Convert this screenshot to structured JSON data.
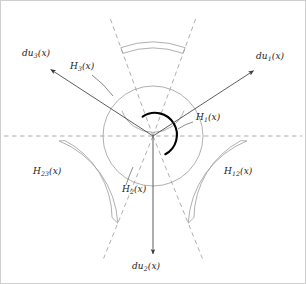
{
  "figure": {
    "name": "conormal-directions-diagram",
    "background_color": "#ffffff",
    "center": {
      "x": 153,
      "y": 136
    },
    "colors": {
      "solid_line": "#5a5a5a",
      "dashed_line": "#9a9a9a",
      "arc_light": "#8d8d8d",
      "arc_bold": "#000000",
      "label_text": "#1a1a1a",
      "border": "#cccccc"
    }
  },
  "labels": {
    "du1": {
      "text": "du",
      "sub": "1",
      "arg": "(x)",
      "x": 256,
      "y": 57
    },
    "du2": {
      "text": "du",
      "sub": "2",
      "arg": "(x)",
      "x": 132,
      "y": 266
    },
    "du3": {
      "text": "du",
      "sub": "3",
      "arg": "(x)",
      "x": 22,
      "y": 54
    },
    "H1": {
      "text": "H",
      "sub": "1",
      "arg": "(x)",
      "x": 196,
      "y": 118
    },
    "H2": {
      "text": "H",
      "sub": "2",
      "arg": "(x)",
      "x": 122,
      "y": 190
    },
    "H3": {
      "text": "H",
      "sub": "3",
      "arg": "(x)",
      "x": 70,
      "y": 67
    },
    "H12": {
      "text": "H",
      "sub": "12",
      "arg": "(x)",
      "x": 224,
      "y": 172
    },
    "H23": {
      "text": "H",
      "sub": "23",
      "arg": "(x)",
      "x": 33,
      "y": 172
    }
  },
  "geometry": {
    "arrows": [
      {
        "name": "du1-arrow",
        "angle_deg": 33,
        "length": 120
      },
      {
        "name": "du2-arrow",
        "angle_deg": -90,
        "length": 118
      },
      {
        "name": "du3-arrow",
        "angle_deg": 147,
        "length": 122
      }
    ],
    "dashed_rays": [
      {
        "name": "ray-upper-right",
        "angle_deg": 70,
        "length": 128
      },
      {
        "name": "ray-upper-left",
        "angle_deg": 110,
        "length": 128
      },
      {
        "name": "ray-lower-left",
        "angle_deg": 248,
        "length": 132
      },
      {
        "name": "ray-lower-right",
        "angle_deg": 292,
        "length": 132
      }
    ],
    "dashed_axis": {
      "name": "horizontal-axis",
      "y": 136,
      "x1": 4,
      "x2": 302
    },
    "bold_arc": {
      "name": "H1-bold-arc",
      "radius": 22,
      "start_deg": 118,
      "end_deg": -56
    },
    "light_circle": {
      "name": "outer-light-circle",
      "radius": 50
    },
    "inner_arc": {
      "name": "inner-light-arc",
      "radius": 33,
      "start_deg": 200,
      "end_deg": 340
    },
    "sector_arc_pairs": [
      {
        "name": "top-sector-arcs",
        "radius_outer": 94,
        "radius_inner": 88,
        "start_deg": 70,
        "end_deg": 110
      },
      {
        "name": "lower-right-sector-arcs",
        "radius_outer": 94,
        "radius_inner": 88,
        "start_deg": -68,
        "end_deg": -3
      },
      {
        "name": "lower-left-sector-arcs",
        "radius_outer": 94,
        "radius_inner": 88,
        "start_deg": 183,
        "end_deg": 248
      }
    ],
    "leaders": [
      {
        "name": "H1-leader",
        "x1": 193,
        "y1": 122,
        "x2": 178,
        "y2": 129
      },
      {
        "name": "H2-leader",
        "x1": 126,
        "y1": 185,
        "x2": 133,
        "y2": 167
      },
      {
        "name": "H3-leader",
        "x1": 92,
        "y1": 75,
        "x2": 113,
        "y2": 96
      }
    ]
  }
}
